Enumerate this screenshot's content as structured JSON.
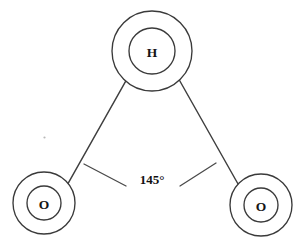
{
  "diagram": {
    "type": "molecular-structure",
    "background_color": "#ffffff",
    "stroke_color": "#3a3a3a",
    "label_color": "#151515",
    "atoms": [
      {
        "id": "hydrogen-top",
        "label": "H",
        "element": "H",
        "cx": 152,
        "cy": 51,
        "shell_r": 40,
        "core_r": 23,
        "label_dy": 1
      },
      {
        "id": "oxygen-left",
        "label": "O",
        "element": "O",
        "cx": 44,
        "cy": 203,
        "shell_r": 31,
        "core_r": 17,
        "label_dy": 1
      },
      {
        "id": "oxygen-right",
        "label": "O",
        "element": "O",
        "cx": 261,
        "cy": 205,
        "shell_r": 31,
        "core_r": 17,
        "label_dy": 1
      }
    ],
    "bonds": [
      {
        "id": "bond-h-o-left",
        "from": "hydrogen-top",
        "to": "oxygen-left",
        "x1": 125.6,
        "y1": 81.3,
        "x2": 68.1,
        "y2": 183.4
      },
      {
        "id": "bond-h-o-right",
        "from": "hydrogen-top",
        "to": "oxygen-right",
        "x1": 179.3,
        "y1": 80.0,
        "x2": 238.6,
        "y2": 185.0
      }
    ],
    "angle_marker": {
      "id": "bond-angle-145",
      "value": "145°",
      "value_number": 145,
      "unit": "degrees",
      "label_x": 152,
      "label_y": 179,
      "left_arm": {
        "x1": 84,
        "y1": 164,
        "x2": 126,
        "y2": 186
      },
      "right_arm": {
        "x1": 180,
        "y1": 186,
        "x2": 216,
        "y2": 163
      }
    },
    "artifact_speck": {
      "id": "stray-speck",
      "cx": 44.5,
      "cy": 137.5,
      "r": 1.1
    }
  }
}
